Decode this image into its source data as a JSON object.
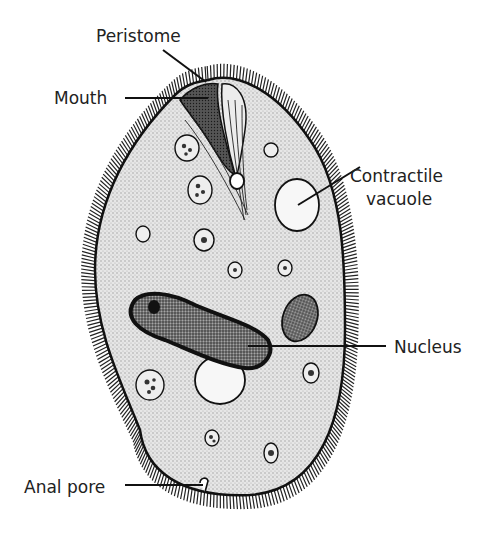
{
  "diagram": {
    "labels": {
      "peristome": "Peristome",
      "mouth": "Mouth",
      "contractile_vacuole_line1": "Contractile",
      "contractile_vacuole_line2": "vacuole",
      "nucleus": "Nucleus",
      "anal_pore": "Anal pore"
    },
    "colors": {
      "ink": "#111111",
      "cytoplasm": "#d9d9d9",
      "nucleus_fill": "#6e6e6e",
      "vacuole_fill": "#f7f7f7",
      "background": "#ffffff"
    }
  }
}
